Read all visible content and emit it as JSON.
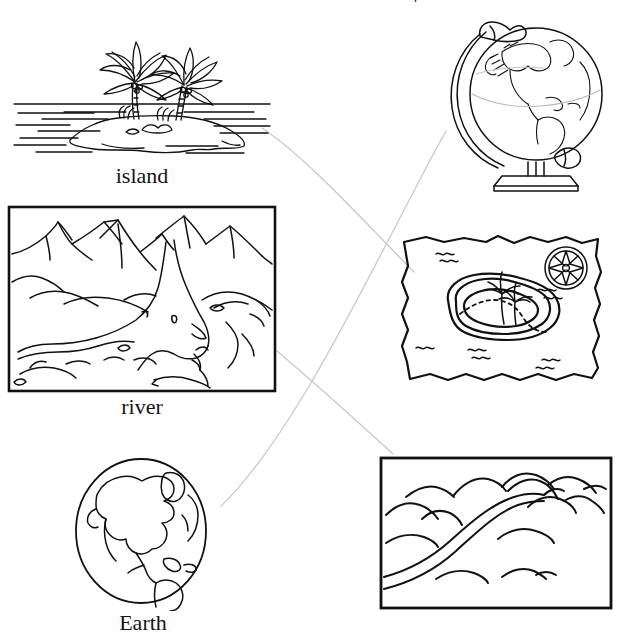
{
  "page": {
    "type": "vocabulary-matching-worksheet",
    "width": 623,
    "height": 639,
    "background_color": "#ffffff",
    "ink_color": "#111111",
    "connector_color": "#c9c9c9",
    "partial_title": "Draw a line to match each word with its picture."
  },
  "left_column": {
    "items": [
      {
        "key": "island",
        "label": "island",
        "icon": "island-with-palm-trees-icon",
        "position": {
          "x": 8,
          "y": 12,
          "width": 268,
          "height": 178
        }
      },
      {
        "key": "river",
        "label": "river",
        "icon": "mountain-river-scene-icon",
        "position": {
          "x": 6,
          "y": 204,
          "width": 272,
          "height": 226
        }
      },
      {
        "key": "earth",
        "label": "Earth",
        "icon": "earth-globe-icon",
        "position": {
          "x": 58,
          "y": 455,
          "width": 170,
          "height": 184
        }
      }
    ]
  },
  "right_column": {
    "items": [
      {
        "key": "desk-globe",
        "icon": "desk-globe-on-stand-icon",
        "matches": "earth",
        "position": {
          "x": 440,
          "y": 12,
          "width": 176,
          "height": 180
        }
      },
      {
        "key": "treasure-map",
        "icon": "treasure-map-with-island-icon",
        "matches": "island",
        "position": {
          "x": 396,
          "y": 228,
          "width": 210,
          "height": 160
        }
      },
      {
        "key": "river-valley",
        "icon": "river-through-hills-icon",
        "matches": "river",
        "position": {
          "x": 378,
          "y": 455,
          "width": 236,
          "height": 164
        }
      }
    ]
  },
  "connectors": [
    {
      "from": "island",
      "to": "treasure-map",
      "path": "M262,128 C310,160 370,228 414,272"
    },
    {
      "from": "earth",
      "to": "desk-globe",
      "path": "M221,506 C300,430 380,250 446,131"
    },
    {
      "from": "river",
      "to": "river-valley",
      "path": "M277,351 C316,384 358,422 393,454"
    }
  ]
}
